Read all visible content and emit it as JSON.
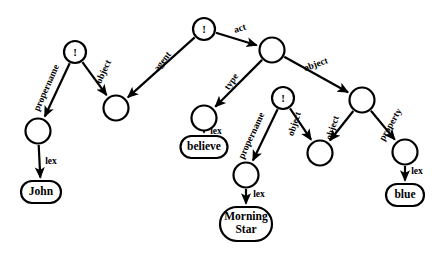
{
  "diagram": {
    "background_color": "#ffffff",
    "stroke_color": "#000000",
    "nodes": [
      {
        "id": "n_top_bang",
        "type": "bang",
        "label": "!",
        "cx": 204,
        "cy": 29,
        "r": 11
      },
      {
        "id": "n_act",
        "type": "plain",
        "label": "",
        "cx": 272,
        "cy": 50,
        "r": 12.5
      },
      {
        "id": "n_left_bang",
        "type": "bang",
        "label": "!",
        "cx": 75,
        "cy": 52,
        "r": 11
      },
      {
        "id": "n_agent",
        "type": "plain",
        "label": "",
        "cx": 116,
        "cy": 108,
        "r": 12.5
      },
      {
        "id": "n_type",
        "type": "plain",
        "label": "",
        "cx": 204,
        "cy": 118,
        "r": 12.5
      },
      {
        "id": "n_mid_bang",
        "type": "bang",
        "label": "!",
        "cx": 283,
        "cy": 98,
        "r": 11
      },
      {
        "id": "n_obj_right",
        "type": "plain",
        "label": "",
        "cx": 362,
        "cy": 100,
        "r": 12.5
      },
      {
        "id": "n_propername",
        "type": "plain",
        "label": "",
        "cx": 38,
        "cy": 131,
        "r": 12.5
      },
      {
        "id": "n_ms_pn",
        "type": "plain",
        "label": "",
        "cx": 246,
        "cy": 175,
        "r": 12.5
      },
      {
        "id": "n_shared_obj",
        "type": "plain",
        "label": "",
        "cx": 320,
        "cy": 153,
        "r": 12.5
      },
      {
        "id": "n_property",
        "type": "plain",
        "label": "",
        "cx": 405,
        "cy": 152,
        "r": 12.5
      }
    ],
    "lex_boxes": [
      {
        "id": "b_john",
        "label": "John",
        "cx": 41,
        "cy": 192,
        "w": 40,
        "h": 22,
        "lines": [
          "John"
        ]
      },
      {
        "id": "b_believe",
        "label": "believe",
        "cx": 204,
        "cy": 147,
        "w": 47,
        "h": 22,
        "lines": [
          "believe"
        ]
      },
      {
        "id": "b_morning",
        "label": "Morning Star",
        "cx": 246,
        "cy": 224,
        "w": 52,
        "h": 34,
        "lines": [
          "Morning",
          "Star"
        ]
      },
      {
        "id": "b_blue",
        "label": "blue",
        "cx": 405,
        "cy": 195,
        "w": 38,
        "h": 22,
        "lines": [
          "blue"
        ]
      }
    ],
    "edges": [
      {
        "id": "e_act",
        "label": "act",
        "from": "n_top_bang",
        "to": "n_act",
        "label_x": 240,
        "label_y": 29,
        "rotate": -18
      },
      {
        "id": "e_agent",
        "label": "agent",
        "from": "n_top_bang",
        "to": "n_agent",
        "label_x": 163,
        "label_y": 62,
        "rotate": -52
      },
      {
        "id": "e_object_l",
        "label": "object",
        "from": "n_left_bang",
        "to": "n_agent",
        "label_x": 104,
        "label_y": 72,
        "rotate": -65
      },
      {
        "id": "e_propername_l",
        "label": "propername",
        "from": "n_left_bang",
        "to": "n_propername",
        "label_x": 47,
        "label_y": 88,
        "rotate": -66
      },
      {
        "id": "e_lex_john",
        "label": "lex",
        "from": "n_propername",
        "to": "b_john",
        "label_x": 51,
        "label_y": 162,
        "rotate": 0
      },
      {
        "id": "e_type",
        "label": "type",
        "from": "n_act",
        "to": "n_type",
        "label_x": 232,
        "label_y": 82,
        "rotate": -55
      },
      {
        "id": "e_lex_believe",
        "label": "lex",
        "from": "n_type",
        "to": "b_believe",
        "label_x": 216,
        "label_y": 132,
        "rotate": 0
      },
      {
        "id": "e_object_r",
        "label": "object",
        "from": "n_act",
        "to": "n_obj_right",
        "label_x": 316,
        "label_y": 65,
        "rotate": -20
      },
      {
        "id": "e_propername_m",
        "label": "propername",
        "from": "n_mid_bang",
        "to": "n_ms_pn",
        "label_x": 252,
        "label_y": 136,
        "rotate": -65
      },
      {
        "id": "e_object_m",
        "label": "object",
        "from": "n_mid_bang",
        "to": "n_shared_obj",
        "label_x": 295,
        "label_y": 124,
        "rotate": -72
      },
      {
        "id": "e_lex_morning",
        "label": "lex",
        "from": "n_ms_pn",
        "to": "b_morning",
        "label_x": 259,
        "label_y": 195,
        "rotate": 0
      },
      {
        "id": "e_object_rr",
        "label": "object",
        "from": "n_obj_right",
        "to": "n_shared_obj",
        "label_x": 333,
        "label_y": 128,
        "rotate": -72
      },
      {
        "id": "e_property",
        "label": "property",
        "from": "n_obj_right",
        "to": "n_property",
        "label_x": 391,
        "label_y": 125,
        "rotate": -60
      },
      {
        "id": "e_lex_blue",
        "label": "lex",
        "from": "n_property",
        "to": "b_blue",
        "label_x": 417,
        "label_y": 172,
        "rotate": 0
      }
    ]
  }
}
